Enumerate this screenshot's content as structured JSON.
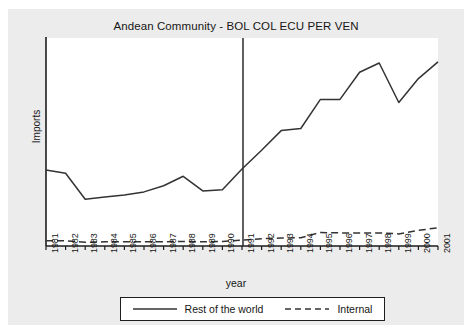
{
  "figure": {
    "title": "Andean Community - BOL COL ECU PER VEN",
    "xlabel": "year",
    "ylabel": "Imports",
    "background_color": "#ececec",
    "plot_background_color": "#ffffff",
    "line_color": "#333333",
    "axis_color": "#1d1d1d"
  },
  "legend": {
    "entries": [
      {
        "label": "Rest of the world",
        "style": "solid",
        "icon": "solid-line-icon"
      },
      {
        "label": "Internal",
        "style": "dashed",
        "icon": "dashed-line-icon"
      }
    ]
  },
  "chart_data": {
    "type": "line",
    "title": "Andean Community - BOL COL ECU PER VEN",
    "xlabel": "year",
    "ylabel": "Imports",
    "x": [
      1981,
      1982,
      1983,
      1984,
      1985,
      1986,
      1987,
      1988,
      1989,
      1990,
      1991,
      1992,
      1993,
      1994,
      1995,
      1996,
      1997,
      1998,
      1999,
      2000,
      2001
    ],
    "categories": [
      "1981",
      "1982",
      "1983",
      "1984",
      "1985",
      "1986",
      "1987",
      "1988",
      "1989",
      "1990",
      "1991",
      "1992",
      "1993",
      "1994",
      "1995",
      "1996",
      "1997",
      "1998",
      "1999",
      "2000",
      "2001"
    ],
    "series": [
      {
        "name": "Rest of the world",
        "style": "solid",
        "values": [
          36.5,
          35.0,
          22.5,
          23.5,
          24.5,
          26.0,
          29.0,
          33.5,
          26.5,
          27.0,
          37.0,
          46.0,
          55.5,
          56.5,
          70.5,
          70.5,
          83.5,
          88.0,
          69.0,
          80.5,
          88.5
        ]
      },
      {
        "name": "Internal",
        "style": "dashed",
        "values": [
          2.5,
          2.5,
          1.8,
          2.0,
          2.0,
          2.0,
          2.0,
          2.2,
          2.0,
          2.2,
          2.8,
          3.5,
          3.8,
          4.0,
          6.5,
          6.3,
          6.3,
          6.3,
          5.8,
          7.5,
          8.8
        ]
      }
    ],
    "ylim": [
      0,
      100
    ],
    "yticks": [],
    "ytick_labels": [],
    "grid": false,
    "legend_position": "below-axes",
    "annotations": [
      {
        "type": "vertical-reference-line",
        "x": 1991,
        "label": ""
      }
    ]
  }
}
